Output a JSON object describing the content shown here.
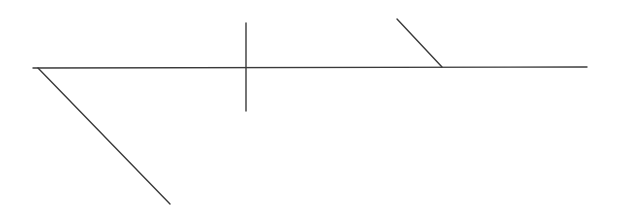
{
  "diagram": {
    "width": 618,
    "height": 221,
    "background": "#ffffff",
    "stroke_color": "#3a3a3a",
    "stroke_width": 1.4,
    "lines": [
      {
        "name": "main-horizontal-line",
        "x1": 33,
        "y1": 68,
        "x2": 587,
        "y2": 67
      },
      {
        "name": "lower-left-diagonal-line",
        "x1": 38,
        "y1": 68,
        "x2": 170,
        "y2": 204
      },
      {
        "name": "vertical-cross-line",
        "x1": 246,
        "y1": 23,
        "x2": 246,
        "y2": 111
      },
      {
        "name": "upper-right-diagonal-line",
        "x1": 397,
        "y1": 19,
        "x2": 442,
        "y2": 67
      }
    ]
  }
}
